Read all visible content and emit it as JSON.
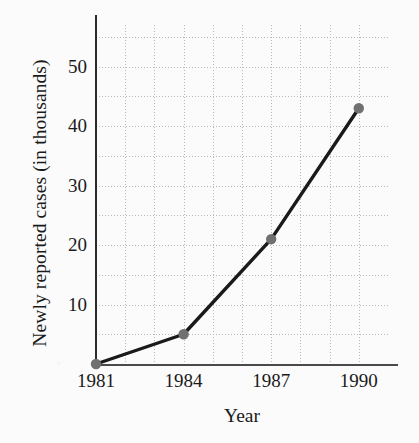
{
  "chart_data": {
    "type": "line",
    "title": "",
    "xlabel": "Year",
    "ylabel": "Newly reported cases (in thousands)",
    "x": [
      1981,
      1984,
      1987,
      1990
    ],
    "values": [
      0,
      5,
      21,
      43
    ],
    "categories": [
      "1981",
      "1984",
      "1987",
      "1990"
    ],
    "series": [
      {
        "name": "Newly reported cases",
        "values": [
          0,
          5,
          21,
          43
        ]
      }
    ],
    "xlim": [
      1981,
      1991
    ],
    "ylim": [
      0,
      57
    ],
    "x_tick_labels": [
      "1981",
      "1984",
      "1987",
      "1990"
    ],
    "x_tick_values": [
      1981,
      1984,
      1987,
      1990
    ],
    "y_tick_labels": [
      "10",
      "20",
      "30",
      "40",
      "50"
    ],
    "y_tick_values": [
      10,
      20,
      30,
      40,
      50
    ],
    "y_gridline_values": [
      5,
      10,
      15,
      20,
      25,
      30,
      35,
      40,
      45,
      50,
      55
    ],
    "x_gridline_values": [
      1982,
      1983,
      1984,
      1985,
      1986,
      1987,
      1988,
      1989,
      1990,
      1991
    ],
    "grid": true,
    "grid_style": "dotted",
    "legend": "none",
    "line_color": "#1a1a1a",
    "marker_color": "#707070",
    "marker_shape": "circle",
    "grid_color": "#b9b9b9",
    "axis_color": "#2a2a2a",
    "background_color": "#fbfbfb",
    "points": [
      {
        "x": 1981,
        "y": 0,
        "label": "1981"
      },
      {
        "x": 1984,
        "y": 5,
        "label": "1984"
      },
      {
        "x": 1987,
        "y": 21,
        "label": "1987"
      },
      {
        "x": 1990,
        "y": 43,
        "label": "1990"
      }
    ]
  }
}
